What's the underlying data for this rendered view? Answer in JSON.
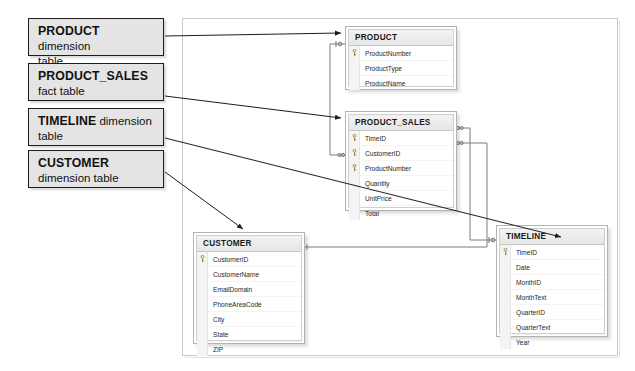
{
  "diagram": {
    "callouts": [
      {
        "id": "callout-product",
        "strong": "PRODUCT",
        "rest": " dimension",
        "line2": "table",
        "target": "PRODUCT"
      },
      {
        "id": "callout-product-sales",
        "strong": "PRODUCT_SALES",
        "rest": "",
        "line2": "fact table",
        "target": "PRODUCT_SALES"
      },
      {
        "id": "callout-timeline",
        "strong": "TIMELINE",
        "rest": " dimension",
        "line2": "table",
        "target": "TIMELINE"
      },
      {
        "id": "callout-customer",
        "strong": "CUSTOMER",
        "rest": "",
        "line2": "dimension table",
        "target": "CUSTOMER"
      }
    ],
    "tables": [
      {
        "id": "table-product",
        "name": "PRODUCT",
        "role": "dimension",
        "fields": [
          {
            "name": "ProductNumber",
            "key": true
          },
          {
            "name": "ProductType",
            "key": false
          },
          {
            "name": "ProductName",
            "key": false
          }
        ]
      },
      {
        "id": "table-product-sales",
        "name": "PRODUCT_SALES",
        "role": "fact",
        "fields": [
          {
            "name": "TimeID",
            "key": true
          },
          {
            "name": "CustomerID",
            "key": true
          },
          {
            "name": "ProductNumber",
            "key": true
          },
          {
            "name": "Quantity",
            "key": false
          },
          {
            "name": "UnitPrice",
            "key": false
          },
          {
            "name": "Total",
            "key": false
          }
        ]
      },
      {
        "id": "table-customer",
        "name": "CUSTOMER",
        "role": "dimension",
        "fields": [
          {
            "name": "CustomerID",
            "key": true
          },
          {
            "name": "CustomerName",
            "key": false
          },
          {
            "name": "EmailDomain",
            "key": false
          },
          {
            "name": "PhoneAreaCode",
            "key": false
          },
          {
            "name": "City",
            "key": false
          },
          {
            "name": "State",
            "key": false
          },
          {
            "name": "ZIP",
            "key": false
          }
        ]
      },
      {
        "id": "table-timeline",
        "name": "TIMELINE",
        "role": "dimension",
        "fields": [
          {
            "name": "TimeID",
            "key": true
          },
          {
            "name": "Date",
            "key": false
          },
          {
            "name": "MonthID",
            "key": false
          },
          {
            "name": "MonthText",
            "key": false
          },
          {
            "name": "QuarterID",
            "key": false
          },
          {
            "name": "QuarterText",
            "key": false
          },
          {
            "name": "Year",
            "key": false
          }
        ]
      }
    ],
    "relationships": [
      {
        "id": "rel-product-sales",
        "from_table": "PRODUCT",
        "from_field": "ProductNumber",
        "to_table": "PRODUCT_SALES",
        "to_field": "ProductNumber",
        "from_cardinality": "1",
        "to_cardinality": "many"
      },
      {
        "id": "rel-customer-sales",
        "from_table": "CUSTOMER",
        "from_field": "CustomerID",
        "to_table": "PRODUCT_SALES",
        "to_field": "CustomerID",
        "from_cardinality": "1",
        "to_cardinality": "many"
      },
      {
        "id": "rel-timeline-sales",
        "from_table": "TIMELINE",
        "from_field": "TimeID",
        "to_table": "PRODUCT_SALES",
        "to_field": "TimeID",
        "from_cardinality": "1",
        "to_cardinality": "many"
      }
    ],
    "colors": {
      "callout_fill": "#e4e4e4",
      "callout_border": "#1d1d1d",
      "table_border": "#b2b2b2",
      "header_fill": "#eeeeee",
      "connector": "#4a4a4a",
      "canvas_border": "#c8c8c8"
    }
  }
}
